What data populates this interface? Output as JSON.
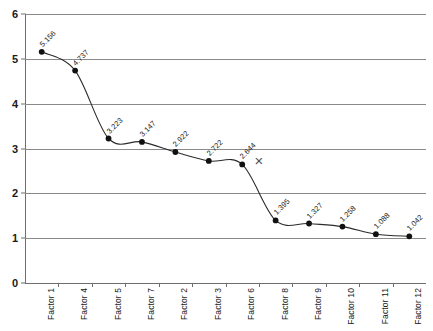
{
  "chart_data": {
    "type": "line",
    "title": "",
    "subtitle": "",
    "xlabel": "",
    "ylabel": "",
    "categories": [
      "Factor 1",
      "Factor 4",
      "Factor 5",
      "Factor 7",
      "Factor 2",
      "Factor 3",
      "Factor 6",
      "Factor 8",
      "Factor 9",
      "Factor 10",
      "Factor 11",
      "Factor 12"
    ],
    "values": [
      5.156,
      4.737,
      3.223,
      3.147,
      2.922,
      2.722,
      2.644,
      1.395,
      1.327,
      1.258,
      1.088,
      1.042
    ],
    "point_labels": [
      "5.156",
      "4.737",
      "3.223",
      "3.147",
      "2.922",
      "2.722",
      "2.644",
      "1.395",
      "1.327",
      "1.258",
      "1.088",
      "1.042"
    ],
    "ylim": [
      0,
      6
    ],
    "y_ticks": [
      0,
      1,
      2,
      3,
      4,
      5,
      6
    ],
    "y_tick_labels": [
      "0",
      "1",
      "2",
      "3",
      "4",
      "5",
      "6"
    ],
    "grid": true,
    "legend": "none",
    "series_color": "#2b2b2b",
    "marker_color": "#111111",
    "grid_color": "#8a8a8a",
    "annotations": [
      {
        "name": "cutoff-x-mark",
        "text": "×",
        "x_value": 6.55,
        "y_value": 2.72
      }
    ]
  }
}
